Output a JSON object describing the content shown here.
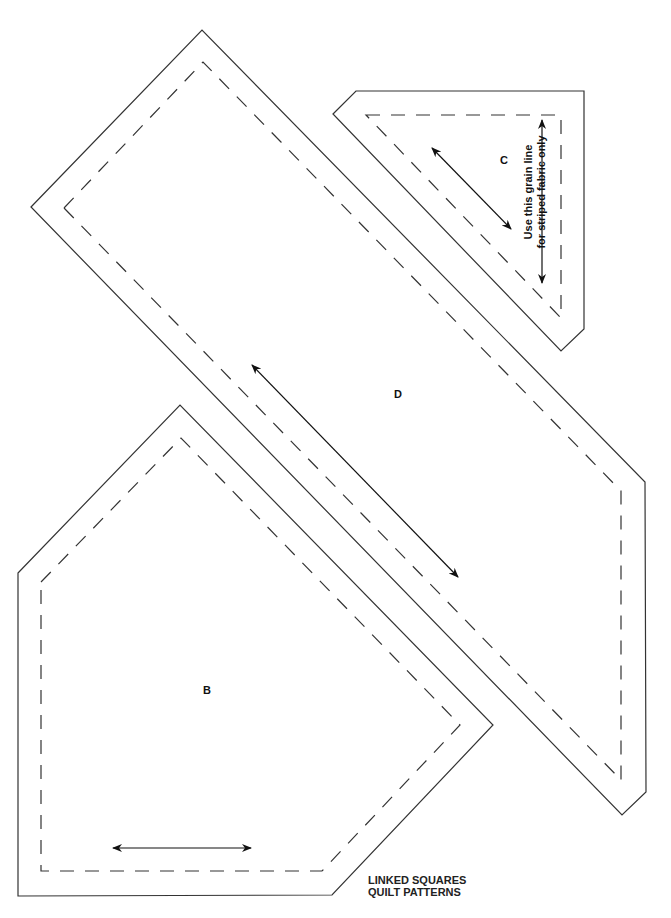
{
  "pieces": [
    {
      "id": "D",
      "label": "D",
      "grain_line": "diagonal"
    },
    {
      "id": "C",
      "label": "C",
      "grain_line": "diagonal",
      "note_line1": "Use this grain line",
      "note_line2": "for striped fabric only"
    },
    {
      "id": "B",
      "label": "B",
      "grain_line": "horizontal"
    }
  ],
  "footer": {
    "line1": "LINKED SQUARES",
    "line2": "QUILT PATTERNS"
  },
  "colors": {
    "line": "#222222",
    "background": "#ffffff"
  }
}
